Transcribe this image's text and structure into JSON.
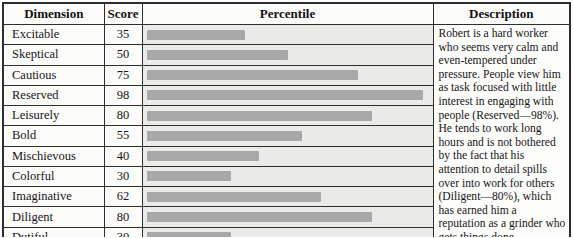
{
  "table": {
    "headers": [
      "Dimension",
      "Score",
      "Percentile",
      "Description"
    ]
  },
  "rows": [
    {
      "dimension": "Excitable",
      "score": 35
    },
    {
      "dimension": "Skeptical",
      "score": 50
    },
    {
      "dimension": "Cautious",
      "score": 75
    },
    {
      "dimension": "Reserved",
      "score": 98
    },
    {
      "dimension": "Leisurely",
      "score": 80
    },
    {
      "dimension": "Bold",
      "score": 55
    },
    {
      "dimension": "Mischievous",
      "score": 40
    },
    {
      "dimension": "Colorful",
      "score": 30
    },
    {
      "dimension": "Imaginative",
      "score": 62
    },
    {
      "dimension": "Diligent",
      "score": 80
    },
    {
      "dimension": "Dutiful",
      "score": 30
    }
  ],
  "description": {
    "text": "Robert is a hard worker who seems very calm and even-tempered under pressure. People view him as task focused with little interest in engaging with people (Reserved—98%). He tends to work long hours and is not bothered by the fact that his attention to detail spills over into work for others (Diligent—80%), which has earned him a reputation as a grinder who gets things done."
  },
  "colors": {
    "bar_fill": "#a8a8a8",
    "bar_track": "#eaeae8",
    "border": "#2e2e2e",
    "cell_background": "#fbfbfa"
  },
  "chart_data": {
    "type": "bar",
    "orientation": "horizontal",
    "title": "Percentile",
    "categories": [
      "Excitable",
      "Skeptical",
      "Cautious",
      "Reserved",
      "Leisurely",
      "Bold",
      "Mischievous",
      "Colorful",
      "Imaginative",
      "Diligent",
      "Dutiful"
    ],
    "values": [
      35,
      50,
      75,
      98,
      80,
      55,
      40,
      30,
      62,
      80,
      30
    ],
    "xlabel": "",
    "ylabel": "Dimension",
    "xlim": [
      0,
      100
    ],
    "grid": false,
    "legend": false
  }
}
